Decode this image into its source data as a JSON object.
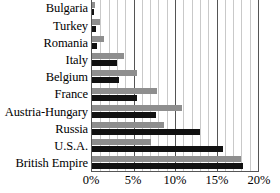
{
  "chart_data": {
    "type": "bar",
    "orientation": "horizontal",
    "title": "",
    "subtitle": "",
    "xlabel": "",
    "ylabel": "",
    "xlim": [
      0,
      20
    ],
    "xunit": "%",
    "xticks": [
      0,
      5,
      10,
      15,
      20
    ],
    "xticklabels": [
      "0%",
      "5%",
      "10%",
      "15%",
      "20%"
    ],
    "minor_gridline_step": 1,
    "grid": true,
    "grid_axis": "x",
    "legend": "none",
    "legend_position": "none",
    "categories": [
      "Bulgaria",
      "Turkey",
      "Romania",
      "Italy",
      "Belgium",
      "France",
      "Austria-Hungary",
      "Russia",
      "U.S.A.",
      "British Empire"
    ],
    "series": [
      {
        "name": "series-a",
        "color": "#8e8e8e",
        "values": [
          0.4,
          1.0,
          1.4,
          3.9,
          5.4,
          7.8,
          10.9,
          8.7,
          7.1,
          17.9
        ]
      },
      {
        "name": "series-b",
        "color": "#111111",
        "values": [
          0.2,
          0.5,
          0.6,
          3.0,
          3.2,
          5.4,
          7.7,
          13.0,
          15.8,
          18.2
        ]
      }
    ]
  },
  "colors": {
    "series_a": "#8e8e8e",
    "series_b": "#111111",
    "gridline_minor": "#c9c9c9",
    "gridline_major": "#555555",
    "axis": "#555555",
    "text": "#000000",
    "background": "#ffffff"
  }
}
